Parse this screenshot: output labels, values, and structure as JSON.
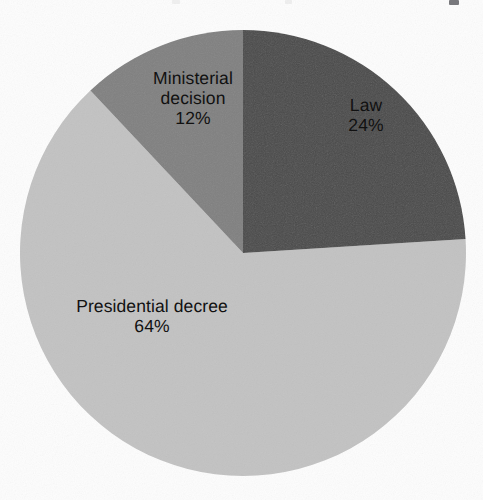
{
  "chart_data": {
    "type": "pie",
    "title": "",
    "subtitle": "",
    "xlabel": "",
    "ylabel": "",
    "legend_position": "none",
    "labels_inside_slices": true,
    "categories": [
      "Law",
      "Presidential decree",
      "Ministerial decision"
    ],
    "values": [
      24,
      64,
      12
    ],
    "value_unit": "%",
    "start_angle_deg": 0,
    "direction": "clockwise",
    "slices": [
      {
        "name": "Law",
        "value": 24,
        "label": "Law",
        "percent_label": "24%",
        "color": "#4a4a4a",
        "start_angle_deg": 0,
        "end_angle_deg": 90
      },
      {
        "name": "Presidential decree",
        "value": 64,
        "label": "Presidential decree",
        "percent_label": "64%",
        "color": "#c2c2c2",
        "start_angle_deg": 90,
        "end_angle_deg": 320
      },
      {
        "name": "Ministerial decision",
        "value": 12,
        "label": "Ministerial decision",
        "percent_label": "12%",
        "color": "#808080",
        "start_angle_deg": 320,
        "end_angle_deg": 360
      }
    ],
    "geometry": {
      "center_x": 243,
      "center_y": 253,
      "radius": 223
    },
    "colors": {
      "background": "#fdfdfd",
      "label_text": "#111111",
      "law": "#4a4a4a",
      "presidential_decree": "#c2c2c2",
      "ministerial_decision": "#808080"
    },
    "ministerial_label_lines": [
      "Ministerial",
      "decision"
    ]
  }
}
